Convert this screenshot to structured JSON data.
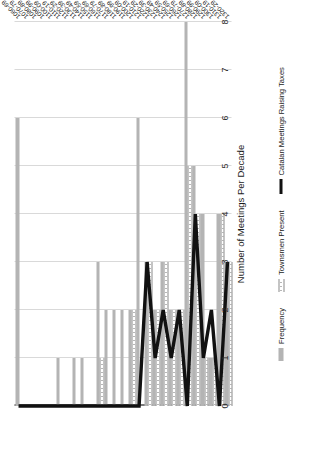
{
  "chart_data": {
    "type": "bar",
    "orientation": "horizontal-rotated",
    "title": "",
    "xlabel": "",
    "ylabel": "Number of Meetings Per Decade",
    "ylim": [
      0,
      8
    ],
    "yticks": [
      "0",
      "1",
      "2",
      "3",
      "4",
      "5",
      "6",
      "7",
      "8"
    ],
    "grid": true,
    "legend_position": "bottom",
    "categories": [
      "1060-69",
      "1070-79",
      "1080-89",
      "1090-99",
      "1100-09",
      "1110-19",
      "1120-29",
      "1130-39",
      "1140-49",
      "1150-59",
      "1160-69",
      "1170-79",
      "1180-89",
      "1190-99",
      "1200-09",
      "1210-19",
      "1220-29",
      "1230-39",
      "1240-49",
      "1250-59",
      "1260-69",
      "1270-79",
      "1280-89",
      "1290-99",
      "1300-09",
      "1310-19",
      "1320-29"
    ],
    "series": [
      {
        "name": "Frequency",
        "color": "#b4b4b4",
        "type": "bar",
        "values": [
          6,
          0,
          0,
          0,
          0,
          1,
          0,
          1,
          1,
          0,
          3,
          2,
          2,
          2,
          2,
          6,
          3,
          2,
          3,
          2,
          2,
          8,
          5,
          4,
          1,
          4,
          3
        ]
      },
      {
        "name": "Townsmen Present",
        "color": "#ffffff",
        "type": "bar",
        "values": [
          0,
          0,
          0,
          0,
          0,
          0,
          0,
          0,
          0,
          0,
          1,
          0,
          0,
          0,
          2,
          0,
          3,
          2,
          3,
          2,
          2,
          5,
          4,
          1,
          1,
          4,
          3
        ]
      },
      {
        "name": "Catalan Meetings Raising Taxes",
        "color": "#111111",
        "type": "line",
        "values": [
          0,
          0,
          0,
          0,
          0,
          0,
          0,
          0,
          0,
          0,
          0,
          0,
          0,
          0,
          0,
          0,
          3,
          1,
          2,
          1,
          2,
          0,
          4,
          1,
          2,
          0,
          3
        ]
      }
    ]
  },
  "legend": {
    "items": [
      {
        "label": "Frequency",
        "swatch": "bar-gray-swatch"
      },
      {
        "label": "Townsmen Present",
        "swatch": "bar-dotted-swatch"
      },
      {
        "label": "Catalan Meetings Raising Taxes",
        "swatch": "line-black-swatch"
      }
    ]
  },
  "axis": {
    "value_axis_title": "Number of Meetings Per Decade"
  },
  "colors": {
    "frequency_bar": "#b4b4b4",
    "townsmen_bar_fill": "#ffffff",
    "townsmen_bar_edge": "#8a8a8a",
    "taxes_line": "#111111",
    "gridline": "#d9d9d9",
    "axis": "#7a7a7a",
    "text": "#1a1a1a",
    "background": "#ffffff"
  }
}
